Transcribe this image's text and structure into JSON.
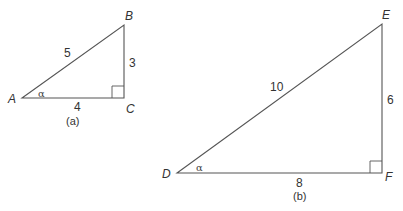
{
  "diagram": {
    "triangle_a": {
      "caption": "(a)",
      "vertices": {
        "A": {
          "label": "A",
          "x": 22,
          "y": 98
        },
        "B": {
          "label": "B",
          "x": 124,
          "y": 25
        },
        "C": {
          "label": "C",
          "x": 124,
          "y": 98
        }
      },
      "sides": {
        "hypotenuse": "5",
        "opposite": "3",
        "adjacent": "4"
      },
      "angle_label": "α",
      "right_angle_at": "C"
    },
    "triangle_b": {
      "caption": "(b)",
      "vertices": {
        "D": {
          "label": "D",
          "x": 177,
          "y": 173
        },
        "E": {
          "label": "E",
          "x": 382,
          "y": 24
        },
        "F": {
          "label": "F",
          "x": 382,
          "y": 173
        }
      },
      "sides": {
        "hypotenuse": "10",
        "opposite": "6",
        "adjacent": "8"
      },
      "angle_label": "α",
      "right_angle_at": "F"
    },
    "colors": {
      "line": "#555555",
      "text": "#333333",
      "background": "#ffffff"
    }
  }
}
